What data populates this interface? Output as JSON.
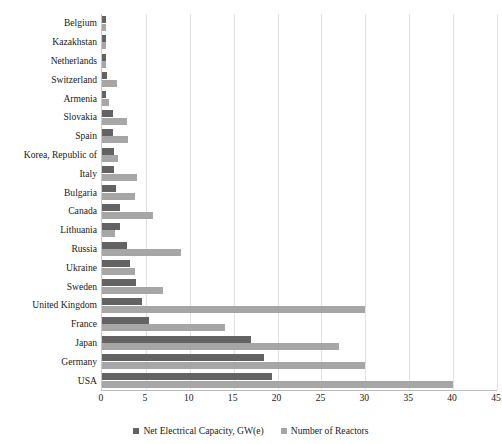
{
  "chart_data": {
    "type": "bar",
    "orientation": "horizontal",
    "title": "",
    "xlabel": "",
    "ylabel": "",
    "xlim": [
      0,
      45
    ],
    "xticks": [
      0,
      5,
      10,
      15,
      20,
      25,
      30,
      35,
      40,
      45
    ],
    "grid": true,
    "legend_position": "bottom",
    "categories": [
      "Belgium",
      "Kazakhstan",
      "Netherlands",
      "Switzerland",
      "Armenia",
      "Slovakia",
      "Spain",
      "Korea, Republic of",
      "Italy",
      "Bulgaria",
      "Canada",
      "Lithuania",
      "Russia",
      "Ukraine",
      "Sweden",
      "United Kingdom",
      "France",
      "Japan",
      "Germany",
      "USA"
    ],
    "series": [
      {
        "name": "Net Electrical Capacity, GW(e)",
        "color": "#636363",
        "values": [
          0.5,
          0.5,
          0.5,
          0.6,
          0.4,
          1.2,
          1.2,
          1.4,
          1.4,
          1.6,
          2.0,
          2.0,
          2.9,
          3.2,
          3.9,
          4.5,
          5.4,
          17.0,
          18.4,
          19.4
        ]
      },
      {
        "name": "Number of Reactors",
        "color": "#a6a6a6",
        "values": [
          0.5,
          0.5,
          0.5,
          1.7,
          0.8,
          2.9,
          3.0,
          1.8,
          4.0,
          3.8,
          5.8,
          1.5,
          9.0,
          3.8,
          7.0,
          30.0,
          14.0,
          27.0,
          30.0,
          40.0
        ]
      }
    ]
  },
  "legend": {
    "items": [
      {
        "label": "Net Electrical Capacity, GW(e)",
        "color": "#636363"
      },
      {
        "label": "Number of Reactors",
        "color": "#a6a6a6"
      }
    ]
  }
}
